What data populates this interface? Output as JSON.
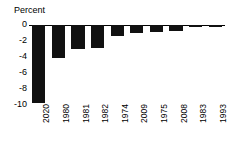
{
  "chart_data": {
    "type": "bar",
    "title": "",
    "subtitle": "",
    "ylabel": "Percent",
    "xlabel": "",
    "categories": [
      "2020",
      "1980",
      "1981",
      "1982",
      "1974",
      "2009",
      "1975",
      "2008",
      "1983",
      "1993"
    ],
    "values": [
      -9.9,
      -4.2,
      -3.1,
      -2.9,
      -1.4,
      -1.0,
      -0.9,
      -0.8,
      -0.3,
      -0.3
    ],
    "series": [
      {
        "name": "Percent change",
        "values": [
          -9.9,
          -4.2,
          -3.1,
          -2.9,
          -1.4,
          -1.0,
          -0.9,
          -0.8,
          -0.3,
          -0.3
        ]
      }
    ],
    "ylim": [
      -10,
      0
    ],
    "yticks": [
      0,
      -2,
      -4,
      -6,
      -8,
      -10
    ],
    "ytick_labels": [
      "0",
      "-2",
      "-4",
      "-6",
      "-8",
      "-10"
    ],
    "grid": false,
    "legend": false,
    "legend_position": "none",
    "bar_color": "#111111",
    "axis_color": "#000000",
    "background_color": "#ffffff",
    "orientation": "vertical",
    "annotations": []
  }
}
